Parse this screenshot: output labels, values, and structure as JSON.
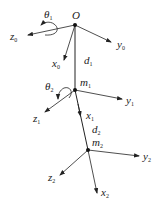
{
  "diagram": {
    "type": "kinematic-frame-diagram",
    "stroke_color": "#222222",
    "background": "#ffffff",
    "nodes": [
      {
        "id": "O",
        "label": "O",
        "sub": ""
      },
      {
        "id": "m1",
        "label": "m",
        "sub": "1"
      },
      {
        "id": "m2",
        "label": "m",
        "sub": "2"
      }
    ],
    "links": [
      {
        "from": "O",
        "to": "m1",
        "label": "d",
        "sub": "1"
      },
      {
        "from": "m1",
        "to": "m2",
        "label": "d",
        "sub": "2"
      }
    ],
    "frames": [
      {
        "origin": "O",
        "axes": [
          {
            "label": "z",
            "sub": "0"
          },
          {
            "label": "y",
            "sub": "0"
          },
          {
            "label": "x",
            "sub": "0"
          }
        ]
      },
      {
        "origin": "m1",
        "axes": [
          {
            "label": "y",
            "sub": "1"
          },
          {
            "label": "z",
            "sub": "1"
          },
          {
            "label": "x",
            "sub": "1"
          }
        ]
      },
      {
        "origin": "m2",
        "axes": [
          {
            "label": "y",
            "sub": "2"
          },
          {
            "label": "z",
            "sub": "2"
          },
          {
            "label": "x",
            "sub": "2"
          }
        ]
      }
    ],
    "rotations": [
      {
        "label": "θ",
        "sub": "1",
        "about": "z0"
      },
      {
        "label": "θ",
        "sub": "2",
        "about": "z1"
      }
    ]
  }
}
